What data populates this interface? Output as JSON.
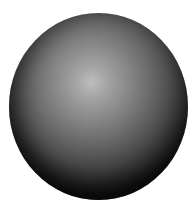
{
  "image": {
    "subject": "shaded gray sphere",
    "background_color": "#ffffff",
    "sphere": {
      "highlight_color": "#bdbdbd",
      "shadow_color": "#161616",
      "bounds": {
        "left": 9,
        "top": 13,
        "width": 179,
        "height": 187
      }
    }
  }
}
